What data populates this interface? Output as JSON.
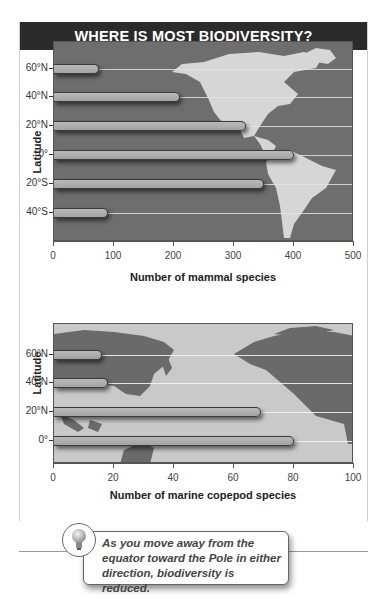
{
  "header": {
    "title": "WHERE IS MOST BIODIVERSITY?"
  },
  "chart_data": [
    {
      "type": "bar",
      "orientation": "horizontal",
      "title": "",
      "background": "Map of the Americas",
      "categories": [
        "60°N",
        "40°N",
        "20°N",
        "0°",
        "20°S",
        "40°S"
      ],
      "values": [
        75,
        210,
        320,
        400,
        350,
        90
      ],
      "xlabel": "Number of mammal species",
      "ylabel": "Latitude",
      "xlim": [
        0,
        500
      ],
      "xticks": [
        "0",
        "100",
        "200",
        "300",
        "400",
        "500"
      ],
      "grid": true
    },
    {
      "type": "bar",
      "orientation": "horizontal",
      "title": "",
      "background": "Map of the Pacific (Asia to North America)",
      "categories": [
        "60°N",
        "40°N",
        "20°N",
        "0°"
      ],
      "values": [
        16,
        18,
        69,
        80
      ],
      "xlabel": "Number of marine copepod species",
      "ylabel": "Latitude",
      "xlim": [
        0,
        100
      ],
      "xticks": [
        "0",
        "20",
        "40",
        "60",
        "80",
        "100"
      ],
      "grid": true
    }
  ],
  "callout": {
    "icon": "lightbulb-icon",
    "lines": [
      "As you move away from the",
      "equator toward the Pole in either",
      "direction, biodiversity is reduced."
    ]
  }
}
